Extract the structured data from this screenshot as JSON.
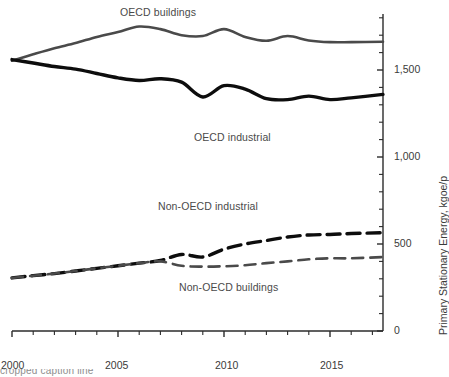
{
  "chart_data": {
    "type": "line",
    "title": "",
    "subtitle": "",
    "xlabel": "",
    "ylabel": "Primary Stationary Energy, kgoe/p",
    "xlim": [
      2000,
      2017.5
    ],
    "ylim": [
      0,
      1800
    ],
    "grid": false,
    "legend_position": "inline-annotations",
    "x_ticks_major": [
      "2000",
      "2005",
      "2010",
      "2015"
    ],
    "x_ticks_major_values": [
      2000,
      2005,
      2010,
      2015
    ],
    "x_minor_tick_interval": 1,
    "y_ticks_major": [
      "0",
      "500",
      "1,000",
      "1,500"
    ],
    "y_ticks_major_values": [
      0,
      500,
      1000,
      1500
    ],
    "y_minor_tick_interval": 100,
    "axis_side": "right",
    "x": [
      2000,
      2001,
      2002,
      2003,
      2004,
      2005,
      2006,
      2007,
      2008,
      2009,
      2010,
      2011,
      2012,
      2013,
      2014,
      2015,
      2016,
      2017.5
    ],
    "series": [
      {
        "name": "OECD buildings",
        "values": [
          1553,
          1590,
          1625,
          1655,
          1690,
          1718,
          1750,
          1735,
          1700,
          1695,
          1735,
          1690,
          1668,
          1695,
          1670,
          1660,
          1660,
          1662
        ],
        "color": "#4a4a4a",
        "style": "solid",
        "width": 2.6,
        "label_x": 2005.1,
        "label_y": 1830
      },
      {
        "name": "OECD industrial",
        "values": [
          1560,
          1540,
          1520,
          1505,
          1480,
          1455,
          1440,
          1450,
          1430,
          1345,
          1410,
          1390,
          1335,
          1330,
          1350,
          1330,
          1340,
          1360
        ],
        "color": "#0d0d0d",
        "style": "solid",
        "width": 3.4,
        "label_x": 2008.6,
        "label_y": 1110
      },
      {
        "name": "Non-OECD industrial",
        "values": [
          305,
          318,
          330,
          345,
          360,
          375,
          390,
          405,
          440,
          425,
          470,
          500,
          520,
          540,
          552,
          555,
          560,
          565
        ],
        "color": "#0d0d0d",
        "style": "dashed",
        "width": 3.4,
        "label_x": 2006.9,
        "label_y": 715
      },
      {
        "name": "Non-OECD buildings",
        "values": [
          305,
          318,
          330,
          345,
          360,
          375,
          390,
          400,
          375,
          370,
          372,
          378,
          390,
          400,
          412,
          418,
          418,
          425
        ],
        "color": "#4a4a4a",
        "style": "dashed",
        "width": 2.6,
        "label_x": 2007.9,
        "label_y": 245
      }
    ]
  },
  "axis": {
    "y_title": "Primary Stationary Energy, kgoe/p",
    "y_labels": [
      "1,500",
      "1,000",
      "500",
      "0"
    ],
    "x_labels": [
      "2000",
      "2005",
      "2010",
      "2015"
    ]
  },
  "annotations": [
    {
      "text": "OECD buildings"
    },
    {
      "text": "OECD industrial"
    },
    {
      "text": "Non-OECD industrial"
    },
    {
      "text": "Non-OECD buildings"
    }
  ],
  "caption": {
    "cropped_text": "cropped caption line"
  }
}
